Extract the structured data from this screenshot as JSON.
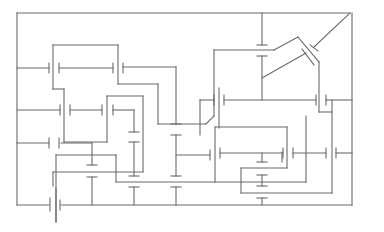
{
  "diagram": {
    "type": "capacitor-network-schematic",
    "stroke_color": "#6a6a6a",
    "background": "#ffffff",
    "wires": [
      [
        [
          17,
          13
        ],
        [
          350,
          13
        ]
      ],
      [
        [
          17,
          13
        ],
        [
          17,
          92
        ]
      ],
      [
        [
          17,
          92
        ],
        [
          17,
          150
        ]
      ],
      [
        [
          17,
          150
        ],
        [
          17,
          205
        ]
      ],
      [
        [
          17,
          205
        ],
        [
          48,
          205
        ]
      ],
      [
        [
          176,
          13
        ],
        [
          258,
          13
        ]
      ],
      [
        [
          350,
          13
        ],
        [
          352,
          13
        ]
      ],
      [
        [
          352,
          13
        ],
        [
          352,
          100
        ]
      ],
      [
        [
          352,
          100
        ],
        [
          352,
          208
        ]
      ],
      [
        [
          352,
          208
        ],
        [
          62,
          208
        ]
      ],
      [
        [
          17,
          68
        ],
        [
          48,
          68
        ]
      ],
      [
        [
          60,
          68
        ],
        [
          113,
          68
        ]
      ],
      [
        [
          125,
          68
        ],
        [
          176,
          68
        ]
      ],
      [
        [
          176,
          68
        ],
        [
          176,
          100
        ]
      ],
      [
        [
          52,
          45
        ],
        [
          52,
          88
        ]
      ],
      [
        [
          52,
          45
        ],
        [
          118,
          45
        ]
      ],
      [
        [
          118,
          45
        ],
        [
          118,
          84
        ]
      ],
      [
        [
          118,
          84
        ],
        [
          158,
          84
        ]
      ],
      [
        [
          158,
          84
        ],
        [
          158,
          138
        ]
      ],
      [
        [
          52,
          88
        ],
        [
          64,
          88
        ]
      ],
      [
        [
          64,
          88
        ],
        [
          64,
          142
        ]
      ],
      [
        [
          64,
          142
        ],
        [
          108,
          142
        ]
      ],
      [
        [
          17,
          111
        ],
        [
          60,
          111
        ]
      ],
      [
        [
          71,
          111
        ],
        [
          101,
          111
        ]
      ],
      [
        [
          113,
          111
        ],
        [
          134,
          111
        ]
      ],
      [
        [
          134,
          111
        ],
        [
          134,
          134
        ]
      ],
      [
        [
          107,
          98
        ],
        [
          143,
          98
        ]
      ],
      [
        [
          107,
          98
        ],
        [
          107,
          111
        ]
      ],
      [
        [
          143,
          98
        ],
        [
          143,
          172
        ]
      ],
      [
        [
          143,
          172
        ],
        [
          53,
          172
        ]
      ],
      [
        [
          53,
          172
        ],
        [
          53,
          190
        ]
      ],
      [
        [
          17,
          143
        ],
        [
          48,
          143
        ]
      ],
      [
        [
          60,
          143
        ],
        [
          92,
          143
        ]
      ],
      [
        [
          92,
          143
        ],
        [
          92,
          165
        ]
      ],
      [
        [
          176,
          100
        ],
        [
          176,
          160
        ]
      ],
      [
        [
          176,
          74
        ],
        [
          176,
          100
        ]
      ],
      [
        [
          176,
          33
        ],
        [
          258,
          33
        ]
      ],
      [
        [
          258,
          13
        ],
        [
          258,
          43
        ]
      ],
      [
        [
          258,
          56
        ],
        [
          258,
          97
        ]
      ],
      [
        [
          220,
          50
        ],
        [
          256,
          50
        ]
      ],
      [
        [
          256,
          50
        ],
        [
          275,
          39
        ]
      ],
      [
        [
          275,
          39
        ],
        [
          292,
          60
        ]
      ],
      [
        [
          292,
          60
        ],
        [
          292,
          114
        ]
      ],
      [
        [
          292,
          114
        ],
        [
          303,
          114
        ]
      ],
      [
        [
          258,
          78
        ],
        [
          284,
          62
        ]
      ],
      [
        [
          301,
          55
        ],
        [
          350,
          13
        ]
      ],
      [
        [
          195,
          50
        ],
        [
          195,
          100
        ]
      ],
      [
        [
          195,
          100
        ],
        [
          207,
          100
        ]
      ],
      [
        [
          207,
          100
        ],
        [
          178,
          100
        ]
      ],
      [
        [
          178,
          125
        ],
        [
          158,
          125
        ]
      ],
      [
        [
          158,
          125
        ],
        [
          158,
          130
        ]
      ],
      [
        [
          213,
          100
        ],
        [
          316,
          100
        ]
      ],
      [
        [
          327,
          100
        ],
        [
          352,
          100
        ]
      ],
      [
        [
          260,
          100
        ],
        [
          260,
          128
        ]
      ],
      [
        [
          54,
          155
        ],
        [
          115,
          155
        ]
      ],
      [
        [
          115,
          155
        ],
        [
          115,
          182
        ]
      ],
      [
        [
          115,
          182
        ],
        [
          214,
          182
        ]
      ],
      [
        [
          214,
          182
        ],
        [
          214,
          130
        ]
      ],
      [
        [
          214,
          130
        ],
        [
          178,
          130
        ]
      ],
      [
        [
          176,
          153
        ],
        [
          178,
          153
        ]
      ],
      [
        [
          195,
          105
        ],
        [
          195,
          165
        ]
      ],
      [
        [
          195,
          165
        ],
        [
          159,
          165
        ]
      ],
      [
        [
          213,
          153
        ],
        [
          248,
          153
        ]
      ],
      [
        [
          258,
          153
        ],
        [
          283,
          153
        ]
      ],
      [
        [
          290,
          153
        ],
        [
          326,
          153
        ]
      ],
      [
        [
          337,
          153
        ],
        [
          352,
          153
        ]
      ],
      [
        [
          215,
          127
        ],
        [
          286,
          127
        ]
      ],
      [
        [
          286,
          127
        ],
        [
          286,
          169
        ]
      ],
      [
        [
          286,
          169
        ],
        [
          241,
          169
        ]
      ],
      [
        [
          241,
          169
        ],
        [
          241,
          192
        ]
      ],
      [
        [
          241,
          192
        ],
        [
          332,
          192
        ]
      ],
      [
        [
          332,
          192
        ],
        [
          332,
          127
        ]
      ],
      [
        [
          92,
          175
        ],
        [
          92,
          208
        ]
      ],
      [
        [
          135,
          186
        ],
        [
          135,
          208
        ]
      ],
      [
        [
          177,
          186
        ],
        [
          177,
          208
        ]
      ],
      [
        [
          262,
          198
        ],
        [
          262,
          208
        ]
      ],
      [
        [
          135,
          143
        ],
        [
          135,
          172
        ]
      ],
      [
        [
          177,
          143
        ],
        [
          177,
          172
        ]
      ]
    ],
    "capacitor_count": 24,
    "labels": []
  }
}
